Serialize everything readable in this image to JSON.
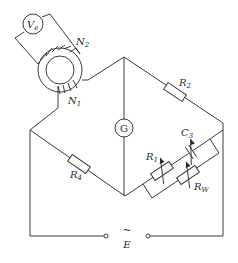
{
  "diagram": {
    "type": "ac-bridge-circuit",
    "colors": {
      "line": "#3a3a3a",
      "text": "#2a2a2a",
      "background": "#ffffff"
    },
    "voltmeter": {
      "symbol": "V",
      "subscript": "e"
    },
    "transformer": {
      "winding_primary": {
        "symbol": "N",
        "subscript": "1"
      },
      "winding_secondary": {
        "symbol": "N",
        "subscript": "2"
      }
    },
    "galvanometer": {
      "label": "G"
    },
    "resistors": {
      "r2": {
        "symbol": "R",
        "subscript": "2"
      },
      "r4": {
        "symbol": "R",
        "subscript": "4"
      },
      "r1": {
        "symbol": "R",
        "subscript": "1"
      },
      "rw": {
        "symbol": "R",
        "subscript": "W"
      }
    },
    "capacitor": {
      "symbol": "C",
      "subscript": "3"
    },
    "source": {
      "symbol": "E",
      "tilde": "~"
    }
  }
}
